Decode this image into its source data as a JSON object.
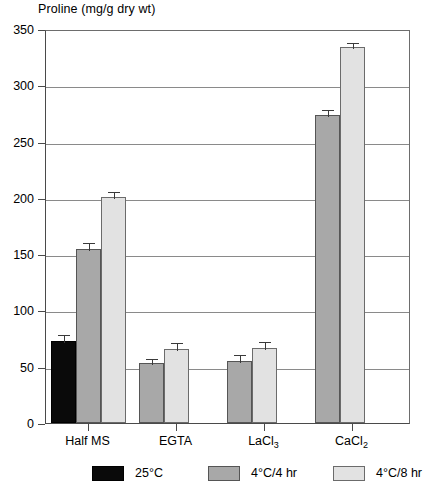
{
  "chart_data": {
    "type": "bar",
    "title": "",
    "ylabel": "Proline (mg/g dry wt)",
    "xlabel": "",
    "ylim": [
      0,
      350
    ],
    "yticks": [
      0,
      50,
      100,
      150,
      200,
      250,
      300,
      350
    ],
    "ytick_labels": [
      "0",
      "50",
      "100",
      "150",
      "200",
      "250",
      "300",
      "350"
    ],
    "grid": "horizontal",
    "legend_position": "bottom",
    "categories": [
      "Half MS",
      "EGTA",
      "LaCl3",
      "CaCl2"
    ],
    "category_labels_html": [
      "Half MS",
      "EGTA",
      "LaCl<sub>3</sub>",
      "CaCl<sub>2</sub>"
    ],
    "series": [
      {
        "name": "25°C",
        "color": "#0a0a0a",
        "values": [
          73,
          null,
          null,
          null
        ],
        "errors": [
          7,
          null,
          null,
          null
        ]
      },
      {
        "name": "4°C/4 hr",
        "color": "#a8a8a8",
        "values": [
          155,
          53,
          55,
          274
        ],
        "errors": [
          7,
          6,
          7,
          6
        ]
      },
      {
        "name": "4°C/8 hr",
        "color": "#e2e2e2",
        "values": [
          201,
          66,
          67,
          334
        ],
        "errors": [
          6,
          7,
          7,
          5
        ]
      }
    ]
  },
  "legend": {
    "items": [
      {
        "label": "25°C"
      },
      {
        "label": "4°C/4 hr"
      },
      {
        "label": "4°C/8 hr"
      }
    ]
  }
}
